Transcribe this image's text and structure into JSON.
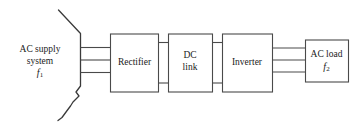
{
  "diagram": {
    "stroke_color": "#4a4a4a",
    "background_color": "#ffffff",
    "source": {
      "name": "ac-supply-system",
      "line1": "AC supply",
      "line2": "system",
      "frequency_symbol": "f",
      "frequency_index": "1",
      "bus_style": "break-line"
    },
    "blocks": [
      {
        "name": "rectifier",
        "line1": "Rectifier",
        "line2": ""
      },
      {
        "name": "dc-link",
        "line1": "DC",
        "line2": "link"
      },
      {
        "name": "inverter",
        "line1": "Inverter",
        "line2": ""
      }
    ],
    "load": {
      "name": "ac-load",
      "line1": "AC load",
      "frequency_symbol": "f",
      "frequency_index": "2"
    },
    "connections": [
      {
        "name": "supply-to-rectifier",
        "conductors": 3,
        "type": "ac"
      },
      {
        "name": "rectifier-to-dclink",
        "conductors": 2,
        "type": "dc"
      },
      {
        "name": "dclink-to-inverter",
        "conductors": 2,
        "type": "dc"
      },
      {
        "name": "inverter-to-acload",
        "conductors": 3,
        "type": "ac"
      }
    ]
  }
}
